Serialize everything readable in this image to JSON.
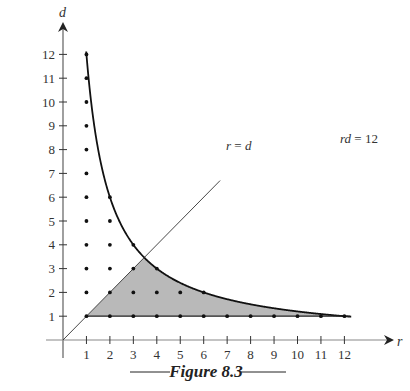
{
  "figure": {
    "caption": "Figure 8.3",
    "x_axis_label": "r",
    "y_axis_label": "d",
    "x_ticks": [
      "1",
      "2",
      "3",
      "4",
      "5",
      "6",
      "7",
      "8",
      "9",
      "10",
      "11",
      "12"
    ],
    "y_ticks": [
      "1",
      "2",
      "3",
      "4",
      "5",
      "6",
      "7",
      "8",
      "9",
      "10",
      "11",
      "12"
    ],
    "curve_label": "rd = 12",
    "line_label": "r = d",
    "colors": {
      "axis": "#888888",
      "curve": "#111111",
      "shade": "#b9b9b9",
      "dots": "#111111"
    }
  },
  "chart_data": {
    "type": "scatter",
    "title": "Figure 8.3",
    "xlabel": "r",
    "ylabel": "d",
    "xlim": [
      0,
      12.5
    ],
    "ylim": [
      0,
      12.5
    ],
    "curves": [
      {
        "name": "rd = 12",
        "equation": "d = 12 / r",
        "r_range": [
          0.97,
          12.3
        ]
      },
      {
        "name": "r = d",
        "equation": "d = r",
        "r_range": [
          0,
          6.8
        ]
      }
    ],
    "shaded_region": "1 <= d <= r, r*d <= 12",
    "lattice_points": [
      {
        "r": 1,
        "d": [
          1,
          2,
          3,
          4,
          5,
          6,
          7,
          8,
          9,
          10,
          11,
          12
        ]
      },
      {
        "r": 2,
        "d": [
          1,
          2,
          3,
          4,
          5,
          6
        ]
      },
      {
        "r": 3,
        "d": [
          1,
          2,
          3,
          4
        ]
      },
      {
        "r": 4,
        "d": [
          1,
          2,
          3
        ]
      },
      {
        "r": 5,
        "d": [
          1,
          2
        ]
      },
      {
        "r": 6,
        "d": [
          1,
          2
        ]
      },
      {
        "r": 7,
        "d": [
          1
        ]
      },
      {
        "r": 8,
        "d": [
          1
        ]
      },
      {
        "r": 9,
        "d": [
          1
        ]
      },
      {
        "r": 10,
        "d": [
          1
        ]
      },
      {
        "r": 11,
        "d": [
          1
        ]
      },
      {
        "r": 12,
        "d": [
          1
        ]
      }
    ],
    "grid": false,
    "legend": "none"
  }
}
